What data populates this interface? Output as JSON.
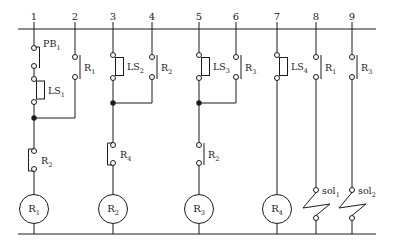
{
  "diagram": {
    "paper_color": "#ffffff",
    "ink_color": "#1b1b1b",
    "rails": [
      "1",
      "2",
      "3",
      "4",
      "5",
      "6",
      "7",
      "8",
      "9"
    ],
    "pb1": {
      "t": "PB",
      "s": "1"
    },
    "limit_switches": [
      {
        "t": "LS",
        "s": "1"
      },
      {
        "t": "LS",
        "s": "2"
      },
      {
        "t": "LS",
        "s": "3"
      },
      {
        "t": "LS",
        "s": "4"
      }
    ],
    "seal_contacts": [
      {
        "t": "R",
        "s": "1"
      },
      {
        "t": "R",
        "s": "2"
      },
      {
        "t": "R",
        "s": "3"
      }
    ],
    "series_contacts": [
      {
        "t": "R",
        "s": "2"
      },
      {
        "t": "R",
        "s": "4"
      },
      {
        "t": "R",
        "s": "2"
      }
    ],
    "output_contacts": [
      {
        "t": "R",
        "s": "1"
      },
      {
        "t": "R",
        "s": "3"
      }
    ],
    "coils": [
      {
        "t": "R",
        "s": "1"
      },
      {
        "t": "R",
        "s": "2"
      },
      {
        "t": "R",
        "s": "3"
      },
      {
        "t": "R",
        "s": "4"
      }
    ],
    "solenoids": [
      {
        "t": "sol",
        "s": "1"
      },
      {
        "t": "sol",
        "s": "2"
      }
    ]
  }
}
